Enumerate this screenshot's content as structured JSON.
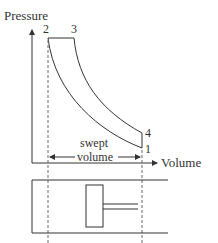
{
  "diagram": {
    "type": "pv-diagram-diesel-cycle",
    "axes": {
      "y_label": "Pressure",
      "x_label": "Volume"
    },
    "points": [
      {
        "id": "1",
        "label": "1"
      },
      {
        "id": "2",
        "label": "2"
      },
      {
        "id": "3",
        "label": "3"
      },
      {
        "id": "4",
        "label": "4"
      }
    ],
    "annotation": {
      "line1": "swept",
      "line2": "volume"
    },
    "colors": {
      "stroke": "#333333",
      "dashed": "#666666",
      "background": "#ffffff"
    }
  }
}
